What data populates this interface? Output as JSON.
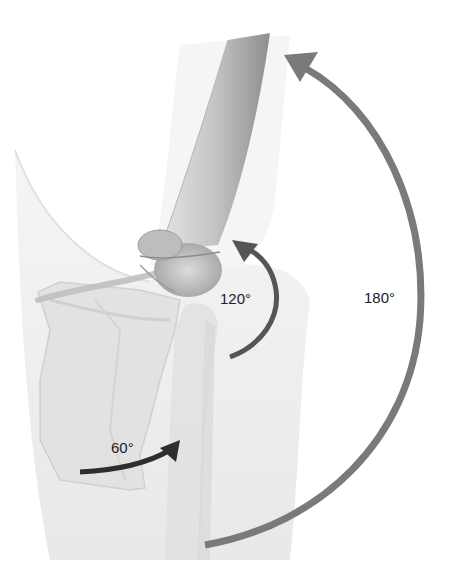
{
  "diagram": {
    "labels": {
      "angle_60": "60°",
      "angle_120": "120°",
      "angle_180": "180°"
    },
    "colors": {
      "arrow_dark": "#2e2e2e",
      "arrow_mid": "#555555",
      "arrow_light": "#7a7a7a",
      "bone": "#cfcfcf",
      "bone_shadow": "#9a9a9a",
      "body": "#eeeeee",
      "background": "#ffffff"
    }
  }
}
